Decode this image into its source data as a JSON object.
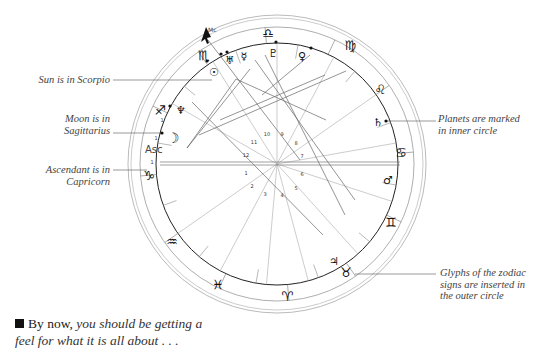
{
  "annotations": {
    "sun": [
      "Sun is in Scorpio"
    ],
    "moon": [
      "Moon is in",
      "Sagittarius"
    ],
    "ascendant": [
      "Ascendant is in",
      "Capricorn"
    ],
    "planets": [
      "Planets are marked",
      "in inner circle"
    ],
    "glyphs": [
      "Glyphs of the zodiac",
      "signs are inserted in",
      "the outer circle"
    ]
  },
  "caption": {
    "lead": "By now,",
    "rest": " you should be getting a feel for what it is all about . . ."
  },
  "chart": {
    "center": [
      277,
      164
    ],
    "radii": {
      "outer1": 149,
      "outer2": 146,
      "zodiac_outer": 137,
      "zodiac_inner": 121
    },
    "ascendant_label": "Asc",
    "midheaven_label": "Mc",
    "zodiac_signs": [
      {
        "name": "libra",
        "glyph": "♎",
        "x": 268,
        "y": 34
      },
      {
        "name": "virgo",
        "glyph": "♍",
        "x": 350,
        "y": 46
      },
      {
        "name": "leo",
        "glyph": "♌",
        "x": 380,
        "y": 90
      },
      {
        "name": "cancer",
        "glyph": "♋",
        "x": 401,
        "y": 153
      },
      {
        "name": "gemini",
        "glyph": "♊",
        "x": 391,
        "y": 223
      },
      {
        "name": "taurus",
        "glyph": "♉",
        "x": 346,
        "y": 273
      },
      {
        "name": "aries",
        "glyph": "♈",
        "x": 287,
        "y": 297
      },
      {
        "name": "pisces",
        "glyph": "♓",
        "x": 218,
        "y": 285
      },
      {
        "name": "aquarius",
        "glyph": "♒",
        "x": 172,
        "y": 242
      },
      {
        "name": "capricorn",
        "glyph": "♑",
        "x": 149,
        "y": 176
      },
      {
        "name": "sagittarius",
        "glyph": "♐",
        "x": 160,
        "y": 111
      },
      {
        "name": "scorpio",
        "glyph": "♏",
        "x": 204,
        "y": 56
      }
    ],
    "planets": [
      {
        "name": "sun",
        "glyph": "☉",
        "x": 214,
        "y": 73
      },
      {
        "name": "moon",
        "glyph": "☽",
        "x": 173,
        "y": 139
      },
      {
        "name": "neptune",
        "glyph": "♆",
        "x": 181,
        "y": 111
      },
      {
        "name": "uranus",
        "glyph": "♅",
        "x": 230,
        "y": 61
      },
      {
        "name": "mercury",
        "glyph": "☿",
        "x": 244,
        "y": 57
      },
      {
        "name": "pluto",
        "glyph": "♇",
        "x": 273,
        "y": 54
      },
      {
        "name": "venus",
        "glyph": "♀",
        "x": 302,
        "y": 57
      },
      {
        "name": "saturn",
        "glyph": "♄",
        "x": 378,
        "y": 123
      },
      {
        "name": "mars",
        "glyph": "♂",
        "x": 388,
        "y": 181
      },
      {
        "name": "jupiter",
        "glyph": "♃",
        "x": 334,
        "y": 262
      }
    ],
    "planet_dots": [
      [
        207,
        61
      ],
      [
        221,
        54
      ],
      [
        227,
        52
      ],
      [
        276,
        42
      ],
      [
        311,
        48
      ],
      [
        386,
        121
      ],
      [
        162,
        133
      ],
      [
        170,
        106
      ]
    ],
    "house_numbers": [
      {
        "n": "1",
        "x": 246,
        "y": 175
      },
      {
        "n": "2",
        "x": 252,
        "y": 188
      },
      {
        "n": "3",
        "x": 265,
        "y": 196
      },
      {
        "n": "4",
        "x": 282,
        "y": 197
      },
      {
        "n": "5",
        "x": 296,
        "y": 190
      },
      {
        "n": "6",
        "x": 302,
        "y": 176
      },
      {
        "n": "7",
        "x": 302,
        "y": 158
      },
      {
        "n": "8",
        "x": 296,
        "y": 145
      },
      {
        "n": "9",
        "x": 282,
        "y": 136
      },
      {
        "n": "10",
        "x": 267,
        "y": 136
      },
      {
        "n": "11",
        "x": 254,
        "y": 144
      },
      {
        "n": "12",
        "x": 246,
        "y": 157
      }
    ],
    "band_numbers": [
      {
        "n": "1",
        "x": 162,
        "y": 122
      },
      {
        "n": "1",
        "x": 156,
        "y": 140
      },
      {
        "n": "1",
        "x": 152,
        "y": 164
      }
    ]
  }
}
